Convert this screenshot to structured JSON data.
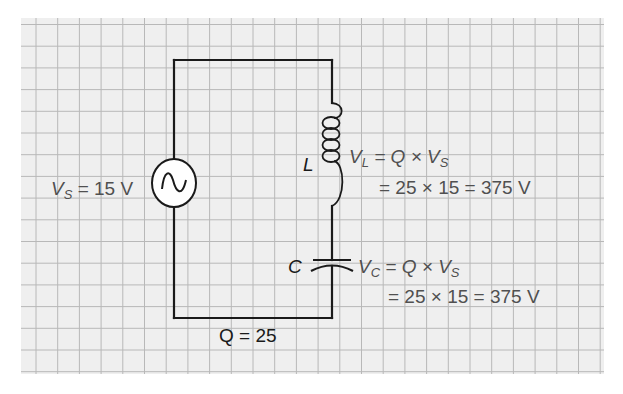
{
  "figure": {
    "background_color": "#ffffff",
    "paper_color": "#efefef",
    "grid_color": "#b8b8b8",
    "wire_color": "#1a1a1a",
    "label_color": "#505050"
  },
  "source": {
    "symbol": "ac-voltage-source",
    "label_var": "V",
    "label_sub": "S",
    "label_rest": " = 15 V"
  },
  "inductor": {
    "symbol": "L",
    "eq1_var": "V",
    "eq1_sub": "L",
    "eq1_mid": " = Q × V",
    "eq1_sub2": "S",
    "eq2": "= 25 × 15 = 375 V"
  },
  "capacitor": {
    "symbol": "C",
    "eq1_var": "V",
    "eq1_sub": "C",
    "eq1_mid": " = Q × V",
    "eq1_sub2": "S",
    "eq2": "= 25 × 15 = 375 V"
  },
  "quality_factor": {
    "label": "Q = 25"
  }
}
